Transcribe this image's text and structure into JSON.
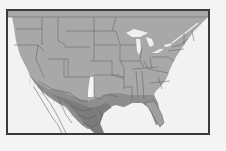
{
  "map": {
    "subject": "Species range map, contiguous United States and northern Mexico",
    "colors": {
      "background": "#f2f2f2",
      "land_range": "#a8a8a8",
      "range_dense": "#8c8c8c",
      "range_core_south": "#7a7a7a",
      "water_lakes": "#f0f0f0",
      "outside_range_patch": "#f4f4f4",
      "borders": "#5c5c5c",
      "frame": "#3a3a3a"
    },
    "legend": [],
    "labels": []
  }
}
